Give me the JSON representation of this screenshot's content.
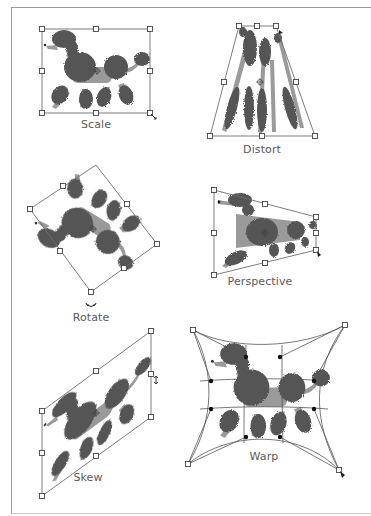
{
  "figure": {
    "colors": {
      "fur_dark": "#555555",
      "fur_light": "#9a9a9a",
      "bounding_box": "#6e6e6e",
      "handle_fill": "#ffffff",
      "label": "#5a5a5a"
    },
    "panels": [
      {
        "id": "scale",
        "label": "Scale",
        "label_pos": [
          96,
          118
        ]
      },
      {
        "id": "distort",
        "label": "Distort",
        "label_pos": [
          262,
          143
        ]
      },
      {
        "id": "rotate",
        "label": "Rotate",
        "label_pos": [
          91,
          311
        ]
      },
      {
        "id": "perspective",
        "label": "Perspective",
        "label_pos": [
          260,
          275
        ]
      },
      {
        "id": "skew",
        "label": "Skew",
        "label_pos": [
          88,
          471
        ]
      },
      {
        "id": "warp",
        "label": "Warp",
        "label_pos": [
          264,
          450
        ]
      }
    ]
  }
}
